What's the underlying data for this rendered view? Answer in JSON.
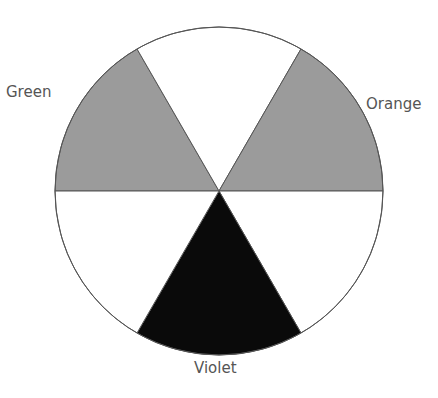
{
  "diagram": {
    "center": [
      219,
      191
    ],
    "radius": 164,
    "segments": [
      {
        "name": "Green",
        "start_deg": 180,
        "end_deg": 240,
        "fill": "#9b9b9b",
        "labeled": true
      },
      {
        "name": "white-top",
        "start_deg": 240,
        "end_deg": 300,
        "fill": "#ffffff",
        "labeled": false
      },
      {
        "name": "Orange",
        "start_deg": 300,
        "end_deg": 360,
        "fill": "#9b9b9b",
        "labeled": true
      },
      {
        "name": "white-lower-right",
        "start_deg": 0,
        "end_deg": 60,
        "fill": "#ffffff",
        "labeled": false
      },
      {
        "name": "Violet",
        "start_deg": 60,
        "end_deg": 120,
        "fill": "#0a0a0a",
        "labeled": true
      },
      {
        "name": "white-lower-left",
        "start_deg": 120,
        "end_deg": 180,
        "fill": "#ffffff",
        "labeled": false
      }
    ],
    "labels": {
      "green": "Green",
      "orange": "Orange",
      "violet": "Violet"
    },
    "colors": {
      "gray_fill": "#9b9b9b",
      "black_fill": "#0a0a0a",
      "outline": "#555555",
      "text": "#555555"
    }
  }
}
